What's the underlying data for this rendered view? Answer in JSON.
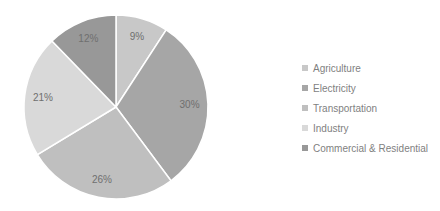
{
  "chart_data": {
    "type": "pie",
    "title": "",
    "categories": [
      "Agriculture",
      "Electricity",
      "Transportation",
      "Industry",
      "Commercial & Residential"
    ],
    "values": [
      9,
      30,
      26,
      21,
      12
    ],
    "labels": [
      "9%",
      "30%",
      "26%",
      "21%",
      "12%"
    ],
    "colors": [
      "#c8c8c8",
      "#a6a6a6",
      "#bfbfbf",
      "#d9d9d9",
      "#989898"
    ],
    "start_angle_deg": 0,
    "direction": "clockwise",
    "legend_position": "right"
  },
  "legend": {
    "items": [
      {
        "label": "Agriculture",
        "color": "#c8c8c8"
      },
      {
        "label": "Electricity",
        "color": "#a6a6a6"
      },
      {
        "label": "Transportation",
        "color": "#bfbfbf"
      },
      {
        "label": "Industry",
        "color": "#d9d9d9"
      },
      {
        "label": "Commercial & Residential",
        "color": "#989898"
      }
    ]
  }
}
